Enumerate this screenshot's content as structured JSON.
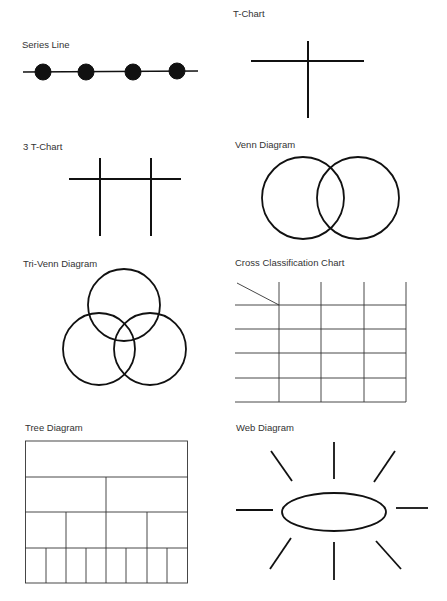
{
  "diagrams": [
    {
      "id": "series-line",
      "title": "Series Line"
    },
    {
      "id": "t-chart",
      "title": "T-Chart"
    },
    {
      "id": "three-t-chart",
      "title": "3 T-Chart"
    },
    {
      "id": "venn-diagram",
      "title": "Venn Diagram"
    },
    {
      "id": "tri-venn-diagram",
      "title": "Tri-Venn Diagram"
    },
    {
      "id": "cross-classification-chart",
      "title": "Cross Classification Chart"
    },
    {
      "id": "tree-diagram",
      "title": "Tree Diagram"
    },
    {
      "id": "web-diagram",
      "title": "Web Diagram"
    }
  ],
  "colors": {
    "stroke": "#111111",
    "text": "#333333",
    "background": "#ffffff"
  }
}
